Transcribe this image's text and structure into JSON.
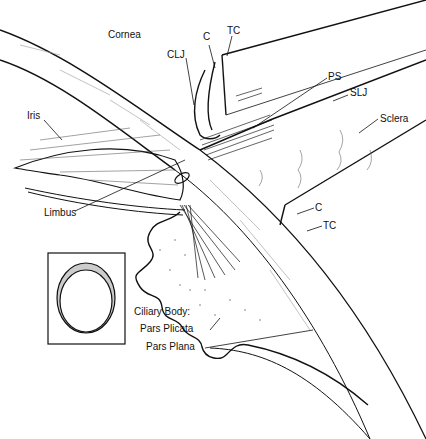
{
  "diagram": {
    "labels": {
      "cornea": "Cornea",
      "clj": "CLJ",
      "c_top": "C",
      "tc_top": "TC",
      "ps": "PS",
      "slj": "SLJ",
      "sclera": "Sclera",
      "iris": "Iris",
      "limbus": "Limbus",
      "c_right": "C",
      "tc_right": "TC",
      "ciliary_body": "Ciliary Body:",
      "pars_plicata": "Pars Plicata",
      "pars_plana": "Pars Plana"
    },
    "inset": {
      "description": "Frontal view: ring with stippled crescent",
      "stroke_color": "#111111",
      "stipple_color": "#888888"
    },
    "colors": {
      "line": "#111111",
      "hatch": "#555555",
      "background": "#ffffff"
    }
  }
}
